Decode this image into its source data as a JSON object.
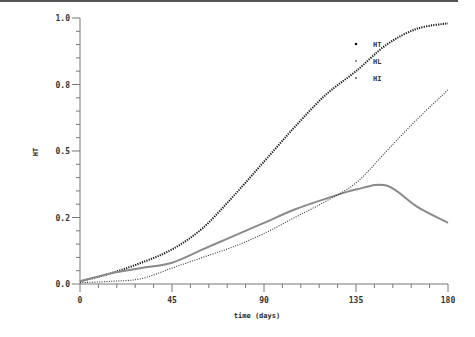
{
  "chart_data": {
    "type": "line",
    "title": "",
    "xlabel": "time (days)",
    "ylabel": "HT",
    "xlim": [
      0,
      180
    ],
    "ylim": [
      0,
      1.0
    ],
    "x_ticks": [
      0,
      45,
      90,
      135,
      180
    ],
    "x_tick_labels": [
      "0",
      "45",
      "90",
      "135",
      "180"
    ],
    "y_ticks": [
      0,
      0.25,
      0.5,
      0.75,
      1.0
    ],
    "y_tick_labels": [
      "0.0",
      "0.2",
      "0.5",
      "0.8",
      "1.0"
    ],
    "grid": false,
    "legend_position": "upper right",
    "x": [
      0,
      15,
      30,
      45,
      60,
      75,
      90,
      105,
      120,
      135,
      150,
      165,
      180
    ],
    "series": [
      {
        "name": "HT",
        "style": "dotted-heavy",
        "color": "#111111",
        "values": [
          0.01,
          0.04,
          0.08,
          0.13,
          0.21,
          0.33,
          0.46,
          0.59,
          0.71,
          0.8,
          0.9,
          0.96,
          0.98
        ]
      },
      {
        "name": "HL",
        "style": "solid-gray",
        "color": "#888888",
        "values": [
          0.01,
          0.04,
          0.06,
          0.08,
          0.13,
          0.18,
          0.23,
          0.28,
          0.32,
          0.355,
          0.37,
          0.29,
          0.23
        ]
      },
      {
        "name": "HI",
        "style": "dotted-light",
        "color": "#333333",
        "values": [
          0.005,
          0.01,
          0.02,
          0.06,
          0.1,
          0.14,
          0.19,
          0.25,
          0.31,
          0.38,
          0.5,
          0.62,
          0.73
        ]
      }
    ]
  },
  "layout": {
    "x0_px": 80,
    "x1_px": 448,
    "y0_px": 284,
    "y1_px": 18
  }
}
